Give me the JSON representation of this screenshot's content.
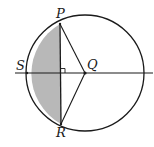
{
  "diagram": {
    "type": "circle-geometry",
    "labels": {
      "P": "P",
      "Q": "Q",
      "R": "R",
      "S": "S"
    },
    "points": {
      "P": [
        60,
        24
      ],
      "Q": [
        85,
        73
      ],
      "R": [
        61,
        124
      ],
      "S": [
        27,
        73
      ],
      "foot": [
        60,
        73
      ]
    },
    "circle": {
      "cx": 85,
      "cy": 73,
      "rx": 59,
      "ry": 58
    },
    "colors": {
      "stroke": "#1a1a1a",
      "shade": "#b8b8b8",
      "background": "#ffffff"
    },
    "annotations": [
      "right angle at intersection of PR and SQ"
    ]
  }
}
